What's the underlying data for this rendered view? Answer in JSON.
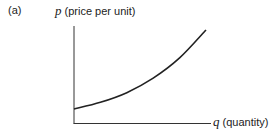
{
  "panel_label": "(a)",
  "chart_data": {
    "type": "line",
    "title": "",
    "ylabel_var": "p",
    "ylabel_text": "(price per unit)",
    "xlabel_var": "q",
    "xlabel_text": "(quantity)",
    "x": [
      0,
      0.2,
      0.4,
      0.6,
      0.8,
      1.0
    ],
    "values": [
      0.15,
      0.22,
      0.32,
      0.47,
      0.68,
      0.97
    ],
    "xlim": [
      0,
      1.05
    ],
    "ylim": [
      0,
      1.0
    ],
    "ticks": false,
    "grid": false,
    "legend": null
  }
}
